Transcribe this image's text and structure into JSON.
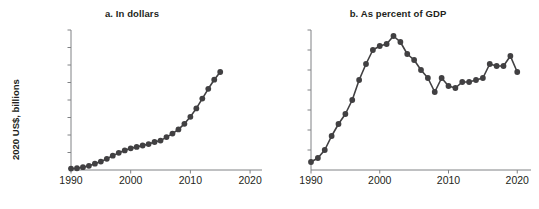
{
  "figure": {
    "background": "#ffffff",
    "ink_color": "#414042",
    "axis_color": "#808285",
    "text_color": "#231f20"
  },
  "chart_data": [
    {
      "type": "line",
      "panel_id": "a",
      "title": "a. In dollars",
      "xlabel": "",
      "ylabel": "2020 US$, billions",
      "xlim": [
        1990,
        2022
      ],
      "ylim": [
        0,
        2000
      ],
      "xticks": [
        1990,
        2000,
        2010,
        2020
      ],
      "xticklabels": [
        "1990",
        "2000",
        "2010",
        "2020"
      ],
      "yticks": [
        0,
        250,
        500,
        750,
        1000,
        1250,
        1500,
        1750,
        2000
      ],
      "yticklabels": [
        "0",
        "250",
        "500",
        "750",
        "1,000",
        "1,250",
        "1,500",
        "1,750",
        "2,000"
      ],
      "grid": false,
      "legend": false,
      "markers": "filled-circle",
      "x": [
        1990,
        1991,
        1992,
        1993,
        1994,
        1995,
        1996,
        1997,
        1998,
        1999,
        2000,
        2001,
        2002,
        2003,
        2004,
        2005,
        2006,
        2007,
        2008,
        2009,
        2010,
        2011,
        2012,
        2013,
        2014,
        2015
      ],
      "values": [
        20,
        25,
        40,
        60,
        90,
        120,
        160,
        205,
        245,
        280,
        310,
        330,
        350,
        370,
        400,
        420,
        470,
        520,
        580,
        660,
        760,
        880,
        1020,
        1160,
        1290,
        1400
      ]
    },
    {
      "type": "line",
      "panel_id": "b",
      "title": "b. As percent of GDP",
      "xlabel": "",
      "ylabel": "Percent of GDP",
      "xlim": [
        1990,
        2022
      ],
      "ylim": [
        0,
        7
      ],
      "xticks": [
        1990,
        2000,
        2010,
        2020
      ],
      "xticklabels": [
        "1990",
        "2000",
        "2010",
        "2020"
      ],
      "yticks": [
        0,
        1,
        2,
        3,
        4,
        5,
        6,
        7
      ],
      "yticklabels": [
        "0",
        "1",
        "2",
        "3",
        "4",
        "5",
        "6",
        "7"
      ],
      "grid": false,
      "legend": false,
      "markers": "filled-circle",
      "x": [
        1990,
        1991,
        1992,
        1993,
        1994,
        1995,
        1996,
        1997,
        1998,
        1999,
        2000,
        2001,
        2002,
        2003,
        2004,
        2005,
        2006,
        2007,
        2008,
        2009,
        2010,
        2011,
        2012,
        2013,
        2014,
        2015,
        2016,
        2017,
        2018,
        2019,
        2020
      ],
      "values": [
        0.4,
        0.6,
        1.0,
        1.7,
        2.3,
        2.8,
        3.5,
        4.5,
        5.3,
        6.0,
        6.2,
        6.3,
        6.7,
        6.4,
        5.8,
        5.5,
        5.0,
        4.6,
        3.9,
        4.6,
        4.2,
        4.1,
        4.4,
        4.4,
        4.5,
        4.6,
        5.3,
        5.2,
        5.2,
        5.7,
        4.9
      ]
    }
  ]
}
